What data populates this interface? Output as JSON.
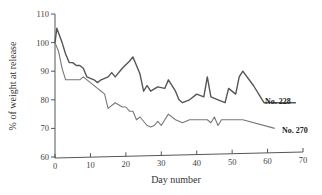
{
  "chart_data": {
    "type": "line",
    "title": "",
    "xlabel": "Day number",
    "ylabel": "% of weight at release",
    "xlim": [
      0,
      70
    ],
    "ylim": [
      60,
      110
    ],
    "xticks": [
      0,
      10,
      20,
      30,
      40,
      50,
      60,
      70
    ],
    "yticks": [
      60,
      70,
      80,
      90,
      100,
      110
    ],
    "grid": false,
    "legend": "inline labels at line ends",
    "series": [
      {
        "name": "No. 228",
        "color": "#555555",
        "x": [
          0,
          0.5,
          2,
          3,
          4,
          5,
          6,
          7,
          8,
          9,
          11,
          12,
          13,
          15,
          16,
          17,
          19,
          21,
          22,
          23,
          24,
          25,
          26,
          27,
          29,
          31,
          32,
          34,
          35,
          36,
          38,
          40,
          42,
          43,
          44,
          46,
          48,
          49,
          51,
          52,
          53,
          56,
          59,
          68
        ],
        "values": [
          100,
          105,
          100,
          96,
          93,
          93,
          92,
          92,
          91,
          88,
          87,
          86,
          87,
          88,
          89.5,
          88,
          91,
          93.5,
          95,
          92,
          89,
          83,
          85,
          83,
          84.5,
          84,
          87,
          83,
          80,
          79,
          80,
          82,
          81,
          88,
          81,
          80,
          79,
          84,
          82,
          88,
          90,
          85,
          79,
          79
        ]
      },
      {
        "name": "No. 270",
        "color": "#777777",
        "x": [
          0,
          1,
          2,
          3,
          5,
          7,
          8,
          10,
          12,
          13,
          14,
          15,
          17,
          19,
          20,
          21,
          22,
          23,
          24,
          26,
          27,
          28,
          29,
          30,
          31,
          32,
          34,
          36,
          38,
          43,
          44,
          45,
          46,
          47,
          53,
          62
        ],
        "values": [
          100,
          97,
          91,
          87,
          87,
          87,
          88,
          86,
          84,
          83,
          82,
          77,
          79,
          77.5,
          77.5,
          76,
          76,
          73,
          74,
          71,
          70.5,
          71,
          72.5,
          71,
          73,
          75,
          73,
          72,
          73,
          73,
          72,
          74,
          71,
          73,
          73,
          70
        ]
      }
    ]
  },
  "labels": {
    "series_228": "No. 228",
    "series_270": "No. 270",
    "xlabel": "Day number",
    "ylabel": "% of weight at release"
  }
}
